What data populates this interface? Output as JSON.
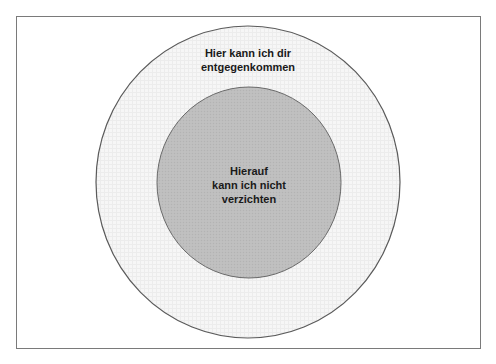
{
  "diagram": {
    "type": "concentric-circles",
    "frame_border_color": "#7a7a7a",
    "outer_circle": {
      "label_lines": [
        "Hier kann ich dir",
        "entgegenkommen"
      ],
      "fill": "#f4f4f4",
      "stroke": "#5a5a5a"
    },
    "inner_circle": {
      "label_lines": [
        "Hierauf",
        "kann ich nicht",
        "verzichten"
      ],
      "fill": "#bdbdbd",
      "stroke": "#6a6a6a"
    }
  }
}
